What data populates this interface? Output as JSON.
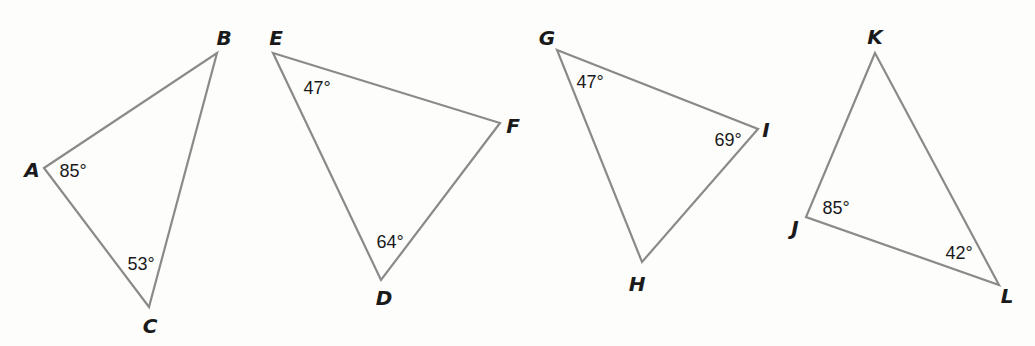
{
  "triangles": [
    {
      "id": "ABC",
      "vertices": [
        {
          "label": "A",
          "x": 44,
          "y": 168,
          "lx": 32,
          "ly": 170
        },
        {
          "label": "B",
          "x": 217,
          "y": 53,
          "lx": 224,
          "ly": 38
        },
        {
          "label": "C",
          "x": 149,
          "y": 307,
          "lx": 150,
          "ly": 326
        }
      ],
      "angles": [
        {
          "vertex": "A",
          "text": "85°",
          "x": 73,
          "y": 171
        },
        {
          "vertex": "C",
          "text": "53°",
          "x": 141,
          "y": 264
        }
      ]
    },
    {
      "id": "DEF",
      "vertices": [
        {
          "label": "E",
          "x": 273,
          "y": 53,
          "lx": 276,
          "ly": 38
        },
        {
          "label": "F",
          "x": 500,
          "y": 123,
          "lx": 513,
          "ly": 126
        },
        {
          "label": "D",
          "x": 381,
          "y": 280,
          "lx": 384,
          "ly": 298
        }
      ],
      "angles": [
        {
          "vertex": "E",
          "text": "47°",
          "x": 317,
          "y": 88
        },
        {
          "vertex": "D",
          "text": "64°",
          "x": 390,
          "y": 242
        }
      ]
    },
    {
      "id": "GHI",
      "vertices": [
        {
          "label": "G",
          "x": 557,
          "y": 50,
          "lx": 547,
          "ly": 38
        },
        {
          "label": "I",
          "x": 758,
          "y": 129,
          "lx": 766,
          "ly": 130
        },
        {
          "label": "H",
          "x": 642,
          "y": 262,
          "lx": 637,
          "ly": 284
        }
      ],
      "angles": [
        {
          "vertex": "G",
          "text": "47°",
          "x": 590,
          "y": 82
        },
        {
          "vertex": "I",
          "text": "69°",
          "x": 728,
          "y": 140
        }
      ]
    },
    {
      "id": "JKL",
      "vertices": [
        {
          "label": "K",
          "x": 875,
          "y": 53,
          "lx": 875,
          "ly": 37
        },
        {
          "label": "J",
          "x": 806,
          "y": 217,
          "lx": 795,
          "ly": 228
        },
        {
          "label": "L",
          "x": 999,
          "y": 285,
          "lx": 1007,
          "ly": 296
        }
      ],
      "angles": [
        {
          "vertex": "J",
          "text": "85°",
          "x": 836,
          "y": 208
        },
        {
          "vertex": "L",
          "text": "42°",
          "x": 959,
          "y": 253
        }
      ]
    }
  ],
  "colors": {
    "edge": "#8a8a8a",
    "text": "#1a1a1a",
    "background": "#fdfdfc"
  }
}
